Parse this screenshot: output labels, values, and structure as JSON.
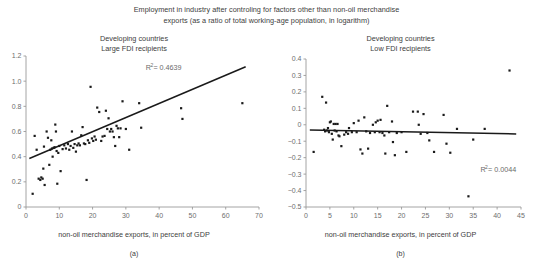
{
  "figure": {
    "suptitle_line1": "Employment in industry after controling for factors other than non-oil merchandise",
    "suptitle_line2": "exports (as a ratio of total working-age population, in logarithm)",
    "axis_color": "#9a9a9a",
    "point_color": "#1a1a1a",
    "trend_color": "#1a1a1a",
    "text_color": "#3d3d3d",
    "tick_color": "#6e6e6e"
  },
  "chart_data": [
    {
      "type": "scatter",
      "panel_id": "a",
      "caption": "(a)",
      "title_line1": "Developing countries",
      "title_line2": "Large FDI recipients",
      "xlabel": "non-oil merchandise exports, in percent of GDP",
      "ylabel": "",
      "xlim": [
        0,
        70
      ],
      "ylim": [
        0,
        1.2
      ],
      "xticks": [
        0,
        10,
        20,
        30,
        40,
        50,
        60,
        70
      ],
      "xtick_labels": [
        "0",
        "10",
        "20",
        "30",
        "40",
        "50",
        "60",
        "70"
      ],
      "yticks": [
        0,
        0.2,
        0.4,
        0.6,
        0.8,
        1.0,
        1.2
      ],
      "ytick_labels": [
        "0",
        "0.2",
        "0.4",
        "0.6",
        "0.8",
        "1.0",
        "1.2"
      ],
      "grid": false,
      "legend": false,
      "annotation": "R² = 0.4639",
      "annotation_base": "R",
      "annotation_sup": "2",
      "annotation_rest": " = 0.4639",
      "annotation_x": 36.0,
      "annotation_y": 1.09,
      "r_squared": 0.4639,
      "trendline": {
        "x0": 1.0,
        "y0": 0.385,
        "x1": 66.0,
        "y1": 1.115
      },
      "points": [
        [
          2.0,
          0.105
        ],
        [
          2.6,
          0.565
        ],
        [
          3.2,
          0.455
        ],
        [
          3.8,
          0.225
        ],
        [
          4.3,
          0.215
        ],
        [
          4.6,
          0.235
        ],
        [
          5.0,
          0.225
        ],
        [
          5.2,
          0.305
        ],
        [
          5.4,
          0.48
        ],
        [
          5.6,
          0.175
        ],
        [
          6.2,
          0.6
        ],
        [
          6.6,
          0.55
        ],
        [
          7.0,
          0.335
        ],
        [
          7.3,
          0.455
        ],
        [
          7.6,
          0.53
        ],
        [
          7.8,
          0.465
        ],
        [
          8.0,
          0.4
        ],
        [
          8.3,
          0.47
        ],
        [
          8.6,
          0.475
        ],
        [
          8.8,
          0.655
        ],
        [
          9.0,
          0.6
        ],
        [
          9.2,
          0.445
        ],
        [
          9.4,
          0.185
        ],
        [
          9.7,
          0.43
        ],
        [
          10.0,
          0.485
        ],
        [
          10.4,
          0.285
        ],
        [
          11.0,
          0.46
        ],
        [
          11.5,
          0.49
        ],
        [
          12.0,
          0.465
        ],
        [
          12.6,
          0.5
        ],
        [
          13.0,
          0.455
        ],
        [
          13.4,
          0.485
        ],
        [
          13.8,
          0.6
        ],
        [
          14.2,
          0.47
        ],
        [
          14.6,
          0.5
        ],
        [
          15.0,
          0.44
        ],
        [
          15.4,
          0.49
        ],
        [
          15.8,
          0.505
        ],
        [
          16.2,
          0.49
        ],
        [
          16.6,
          0.57
        ],
        [
          17.0,
          0.635
        ],
        [
          17.4,
          0.505
        ],
        [
          17.8,
          0.5
        ],
        [
          18.2,
          0.215
        ],
        [
          18.6,
          0.53
        ],
        [
          19.0,
          0.51
        ],
        [
          19.4,
          0.955
        ],
        [
          19.8,
          0.545
        ],
        [
          20.2,
          0.525
        ],
        [
          20.6,
          0.56
        ],
        [
          21.0,
          0.535
        ],
        [
          21.4,
          0.79
        ],
        [
          22.0,
          0.755
        ],
        [
          22.6,
          0.525
        ],
        [
          23.0,
          0.56
        ],
        [
          23.6,
          0.565
        ],
        [
          24.0,
          0.765
        ],
        [
          24.4,
          0.62
        ],
        [
          24.8,
          0.705
        ],
        [
          25.2,
          0.6
        ],
        [
          25.6,
          0.62
        ],
        [
          26.0,
          0.6
        ],
        [
          26.4,
          0.555
        ],
        [
          26.8,
          0.485
        ],
        [
          27.2,
          0.645
        ],
        [
          27.6,
          0.625
        ],
        [
          28.0,
          0.555
        ],
        [
          28.4,
          0.625
        ],
        [
          29.0,
          0.84
        ],
        [
          30.0,
          0.62
        ],
        [
          31.0,
          0.455
        ],
        [
          34.0,
          0.825
        ],
        [
          34.6,
          0.63
        ],
        [
          46.6,
          0.785
        ],
        [
          47.0,
          0.7
        ],
        [
          65.0,
          0.825
        ]
      ]
    },
    {
      "type": "scatter",
      "panel_id": "b",
      "caption": "(b)",
      "title_line1": "Developing countries",
      "title_line2": "Low FDI recipients",
      "xlabel": "non-oil merchandise exports, in percent of GDP",
      "ylabel": "",
      "xlim": [
        0,
        45
      ],
      "ylim": [
        -0.5,
        0.4
      ],
      "xticks": [
        0,
        5,
        10,
        15,
        20,
        25,
        30,
        35,
        40,
        45
      ],
      "xtick_labels": [
        "0",
        "5",
        "10",
        "15",
        "20",
        "25",
        "30",
        "35",
        "40",
        "45"
      ],
      "yticks": [
        -0.5,
        -0.4,
        -0.3,
        -0.2,
        -0.1,
        0,
        0.1,
        0.2,
        0.3,
        0.4
      ],
      "ytick_labels": [
        "−0.5",
        "−0.4",
        "−0.3",
        "−0.2",
        "−0.1",
        "0",
        "0.1",
        "0.2",
        "0.3",
        "0.4"
      ],
      "grid": false,
      "legend": false,
      "annotation": "R² = 0.0044",
      "annotation_base": "R",
      "annotation_sup": "2",
      "annotation_rest": " = 0.0044",
      "annotation_x": 36.5,
      "annotation_y": -0.29,
      "r_squared": 0.0044,
      "trendline": {
        "x0": 0.8,
        "y0": -0.032,
        "x1": 44.0,
        "y1": -0.056
      },
      "points": [
        [
          1.6,
          -0.165
        ],
        [
          3.4,
          0.17
        ],
        [
          3.8,
          -0.03
        ],
        [
          4.0,
          -0.04
        ],
        [
          4.2,
          0.135
        ],
        [
          4.4,
          -0.035
        ],
        [
          4.6,
          -0.02
        ],
        [
          4.8,
          -0.045
        ],
        [
          5.0,
          0.015
        ],
        [
          5.2,
          0.02
        ],
        [
          5.4,
          -0.055
        ],
        [
          5.6,
          -0.09
        ],
        [
          5.8,
          0.005
        ],
        [
          6.0,
          -0.035
        ],
        [
          6.2,
          0.005
        ],
        [
          6.4,
          -0.04
        ],
        [
          6.6,
          0.005
        ],
        [
          6.8,
          -0.065
        ],
        [
          7.0,
          -0.07
        ],
        [
          7.4,
          -0.13
        ],
        [
          8.0,
          -0.06
        ],
        [
          8.4,
          -0.045
        ],
        [
          8.8,
          -0.055
        ],
        [
          9.0,
          -0.02
        ],
        [
          9.6,
          -0.045
        ],
        [
          10.0,
          0.01
        ],
        [
          10.6,
          -0.045
        ],
        [
          11.0,
          0.025
        ],
        [
          11.4,
          -0.15
        ],
        [
          11.8,
          -0.175
        ],
        [
          12.2,
          0.045
        ],
        [
          12.6,
          -0.04
        ],
        [
          13.0,
          -0.145
        ],
        [
          13.4,
          -0.05
        ],
        [
          14.0,
          0.0
        ],
        [
          14.4,
          -0.045
        ],
        [
          14.6,
          0.015
        ],
        [
          15.0,
          0.025
        ],
        [
          15.4,
          -0.045
        ],
        [
          15.6,
          0.03
        ],
        [
          16.0,
          -0.05
        ],
        [
          16.4,
          -0.065
        ],
        [
          16.6,
          -0.175
        ],
        [
          17.0,
          0.115
        ],
        [
          17.4,
          -0.045
        ],
        [
          18.0,
          0.02
        ],
        [
          18.2,
          -0.105
        ],
        [
          18.6,
          -0.185
        ],
        [
          19.0,
          -0.05
        ],
        [
          20.0,
          -0.045
        ],
        [
          21.0,
          -0.165
        ],
        [
          22.4,
          0.08
        ],
        [
          23.4,
          0.08
        ],
        [
          23.6,
          0.0
        ],
        [
          24.0,
          -0.055
        ],
        [
          24.6,
          0.065
        ],
        [
          25.4,
          -0.05
        ],
        [
          25.8,
          -0.095
        ],
        [
          26.8,
          -0.165
        ],
        [
          28.8,
          0.06
        ],
        [
          29.4,
          -0.115
        ],
        [
          30.2,
          -0.17
        ],
        [
          31.6,
          -0.025
        ],
        [
          34.0,
          -0.435
        ],
        [
          35.0,
          -0.09
        ],
        [
          37.4,
          -0.025
        ],
        [
          42.6,
          0.33
        ]
      ]
    }
  ]
}
